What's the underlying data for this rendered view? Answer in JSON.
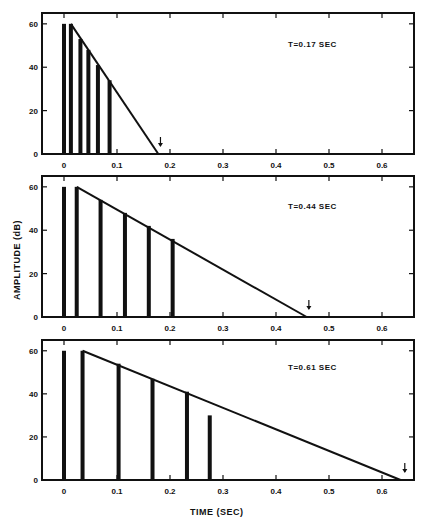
{
  "chart_data": [
    {
      "type": "bar",
      "title": "T=0.17 SEC",
      "annotation": "T=0.17 SEC",
      "xlabel": "TIME (SEC)",
      "ylabel": "AMPLITUDE (dB)",
      "xlim": [
        -0.05,
        0.66
      ],
      "ylim": [
        0,
        65
      ],
      "xticks": [
        0,
        0.1,
        0.2,
        0.3,
        0.4,
        0.5,
        0.6
      ],
      "xtick_labels": [
        "0",
        "0.1",
        "0.2",
        "0.3",
        "0.4",
        "0.5",
        "0.6"
      ],
      "yticks": [
        0,
        20,
        40,
        60
      ],
      "ytick_labels": [
        "0",
        "20",
        "40",
        "60"
      ],
      "grid": false,
      "impulses": {
        "t": [
          0,
          0.013,
          0.031,
          0.046,
          0.064,
          0.086
        ],
        "amplitude": [
          60,
          60,
          53,
          48,
          41,
          34
        ]
      },
      "decay_line": {
        "t": [
          0.013,
          0.178
        ],
        "amplitude": [
          60,
          0
        ]
      },
      "arrow_marker": {
        "t": 0.182,
        "label": "↓"
      }
    },
    {
      "type": "bar",
      "title": "T=0.44 SEC",
      "annotation": "T=0.44 SEC",
      "xlabel": "TIME (SEC)",
      "ylabel": "AMPLITUDE (dB)",
      "xlim": [
        -0.05,
        0.66
      ],
      "ylim": [
        0,
        65
      ],
      "xticks": [
        0,
        0.1,
        0.2,
        0.3,
        0.4,
        0.5,
        0.6
      ],
      "xtick_labels": [
        "0",
        "0.1",
        "0.2",
        "0.3",
        "0.4",
        "0.5",
        "0.6"
      ],
      "yticks": [
        0,
        20,
        40,
        60
      ],
      "ytick_labels": [
        "0",
        "20",
        "40",
        "60"
      ],
      "grid": false,
      "impulses": {
        "t": [
          0,
          0.024,
          0.069,
          0.115,
          0.16,
          0.205
        ],
        "amplitude": [
          60,
          60,
          54,
          48,
          42,
          36
        ]
      },
      "decay_line": {
        "t": [
          0.024,
          0.458
        ],
        "amplitude": [
          60,
          0
        ]
      },
      "arrow_marker": {
        "t": 0.462,
        "label": "↓"
      }
    },
    {
      "type": "bar",
      "title": "T=0.61 SEC",
      "annotation": "T=0.61 SEC",
      "xlabel": "TIME (SEC)",
      "ylabel": "AMPLITUDE (dB)",
      "xlim": [
        -0.05,
        0.66
      ],
      "ylim": [
        0,
        65
      ],
      "xticks": [
        0,
        0.1,
        0.2,
        0.3,
        0.4,
        0.5,
        0.6
      ],
      "xtick_labels": [
        "0",
        "0.1",
        "0.2",
        "0.3",
        "0.4",
        "0.5",
        "0.6"
      ],
      "yticks": [
        0,
        20,
        40,
        60
      ],
      "ytick_labels": [
        "0",
        "20",
        "40",
        "60"
      ],
      "grid": false,
      "impulses": {
        "t": [
          0,
          0.035,
          0.103,
          0.167,
          0.232,
          0.275
        ],
        "amplitude": [
          60,
          60,
          54,
          47,
          41,
          30
        ]
      },
      "decay_line": {
        "t": [
          0.035,
          0.635
        ],
        "amplitude": [
          60,
          0
        ]
      },
      "arrow_marker": {
        "t": 0.643,
        "label": "↓"
      }
    }
  ],
  "labels": {
    "ylabel": "AMPLITUDE (dB)",
    "xlabel": "TIME (SEC)",
    "panel_annotations": [
      "T=0.17 SEC",
      "T=0.44 SEC",
      "T=0.61 SEC"
    ]
  },
  "style": {
    "ink": "#111111",
    "background": "#ffffff"
  }
}
